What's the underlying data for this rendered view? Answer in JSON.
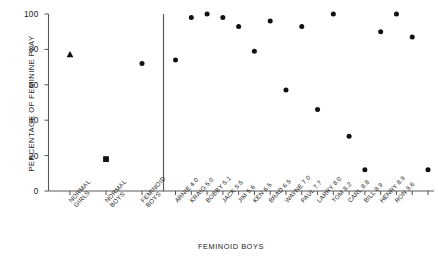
{
  "chart_data": {
    "type": "scatter",
    "title": "",
    "xlabel": "FEMINOID BOYS",
    "ylabel": "PERCENTAGE OF FEMININE PLAY",
    "ylim": [
      0,
      100
    ],
    "yticks": [
      0,
      20,
      40,
      60,
      80,
      100
    ],
    "ytick_labels": [
      "0",
      "20",
      "40",
      "60",
      "80",
      "100"
    ],
    "grid": false,
    "legend": "none",
    "divider_after_category": "FEMINOID BOYS",
    "group_categories": [
      "NORMAL GIRLS",
      "NORMAL BOYS",
      "FEMINOID BOYS"
    ],
    "group_points": [
      {
        "label": "NORMAL GIRLS",
        "label_lines": [
          "NORMAL",
          "GIRLS"
        ],
        "value": 77,
        "marker": "triangle"
      },
      {
        "label": "NORMAL BOYS",
        "label_lines": [
          "NORMAL",
          "BOYS"
        ],
        "value": 18,
        "marker": "square"
      },
      {
        "label": "FEMINOID BOYS",
        "label_lines": [
          "FEMINOID",
          "BOYS"
        ],
        "value": 72,
        "marker": "circle"
      }
    ],
    "individual_categories": [
      "ARNIE 4.0",
      "KRAIG 5.0",
      "BOBBY 5.1",
      "JACK 5.5",
      "JIM 5.6",
      "KEN 6.5",
      "BRAD 6.5",
      "WAYNE 7.0",
      "PAUL 7.7",
      "LARRY 8.0",
      "TOM 8.2",
      "CARL 8.8",
      "BILL 8.9",
      "HENRY 8.9",
      "RON 9.6"
    ],
    "individuals": [
      {
        "name": "ARNIE",
        "score": "4.0",
        "label": "ARNIE 4.0",
        "value": 74,
        "marker": "circle"
      },
      {
        "name": "KRAIG",
        "score": "5.0",
        "label": "KRAIG 5.0",
        "value": 98,
        "marker": "circle"
      },
      {
        "name": "BOBBY",
        "score": "5.1",
        "label": "BOBBY 5.1",
        "value": 100,
        "marker": "circle"
      },
      {
        "name": "JACK",
        "score": "5.5",
        "label": "JACK 5.5",
        "value": 98,
        "marker": "circle"
      },
      {
        "name": "JIM",
        "score": "5.6",
        "label": "JIM 5.6",
        "value": 93,
        "marker": "circle"
      },
      {
        "name": "KEN",
        "score": "6.5",
        "label": "KEN 6.5",
        "value": 79,
        "marker": "circle"
      },
      {
        "name": "BRAD",
        "score": "6.5",
        "label": "BRAD 6.5",
        "value": 96,
        "marker": "circle"
      },
      {
        "name": "WAYNE",
        "score": "7.0",
        "label": "WAYNE 7.0",
        "value": 57,
        "marker": "circle"
      },
      {
        "name": "PAUL",
        "score": "7.7",
        "label": "PAUL 7.7",
        "value": 93,
        "marker": "circle"
      },
      {
        "name": "LARRY",
        "score": "8.0",
        "label": "LARRY 8.0",
        "value": 46,
        "marker": "circle"
      },
      {
        "name": "TOM",
        "score": "8.2",
        "label": "TOM 8.2",
        "value": 100,
        "marker": "circle"
      },
      {
        "name": "CARL",
        "score": "8.8",
        "label": "CARL 8.8",
        "value": 31,
        "marker": "circle"
      },
      {
        "name": "BILL",
        "score": "8.9",
        "label": "BILL 8.9",
        "value": 12,
        "marker": "circle"
      },
      {
        "name": "HENRY",
        "score": "8.9",
        "label": "HENRY 8.9",
        "value": 90,
        "marker": "circle"
      },
      {
        "name": "RON",
        "score": "9.6",
        "label": "RON 9.6",
        "value": 100,
        "marker": "circle"
      },
      {
        "name": "EXTRA1",
        "score": "",
        "label": "",
        "value": 87,
        "marker": "circle"
      },
      {
        "name": "EXTRA2",
        "score": "",
        "label": "",
        "value": 12,
        "marker": "circle"
      }
    ],
    "axis_color": "#555555",
    "marker_color": "#111111"
  },
  "page": {
    "number": ""
  }
}
